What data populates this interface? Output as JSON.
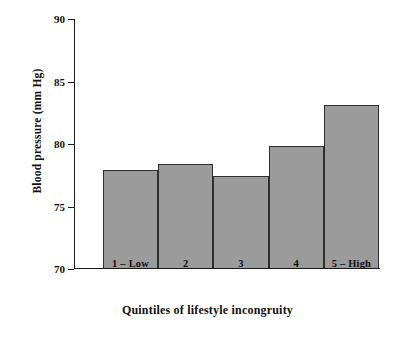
{
  "chart_data": {
    "type": "bar",
    "title": "",
    "xlabel": "Quintiles of  lifestyle incongruity",
    "ylabel": "Blood pressure (mm Hg)",
    "categories": [
      "1 – Low",
      "2",
      "3",
      "4",
      "5 – High"
    ],
    "values": [
      77.8,
      78.3,
      77.3,
      79.7,
      83.0
    ],
    "ylim": [
      70,
      90
    ],
    "yticks": [
      70,
      75,
      80,
      85,
      90
    ],
    "ytick_labels": [
      "70",
      "75",
      "80",
      "85",
      "90"
    ],
    "grid": false,
    "legend": null,
    "bar_fill_color": "#9b9b9b",
    "bar_edge_color": "#2e2e2e",
    "axis_color": "#1a1a1a",
    "background_color": "#ffffff"
  }
}
